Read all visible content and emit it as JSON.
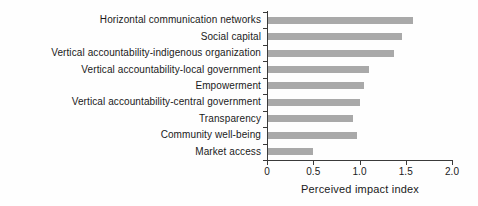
{
  "figure": {
    "background": "#fefefe"
  },
  "chart_data": {
    "type": "bar",
    "orientation": "horizontal",
    "title": "",
    "xlabel": "Perceived impact index",
    "ylabel": "",
    "categories": [
      "Horizontal communication networks",
      "Social capital",
      "Vertical accountability-indigenous organization",
      "Vertical accountability-local government",
      "Empowerment",
      "Vertical accountability-central government",
      "Transparency",
      "Community well-being",
      "Market access"
    ],
    "values": [
      1.58,
      1.46,
      1.37,
      1.1,
      1.05,
      1.0,
      0.93,
      0.97,
      0.5
    ],
    "xlim": [
      0,
      2.0
    ],
    "xtick_labels": [
      "0",
      "0.5",
      "1.0",
      "1.5",
      "2.0"
    ],
    "xtick_values": [
      0,
      0.5,
      1.0,
      1.5,
      2.0
    ],
    "grid": false,
    "legend": false,
    "bar_color": "#a9a9a9",
    "axis_color": "#3a3a3a",
    "text_color": "#1a1a1a"
  }
}
